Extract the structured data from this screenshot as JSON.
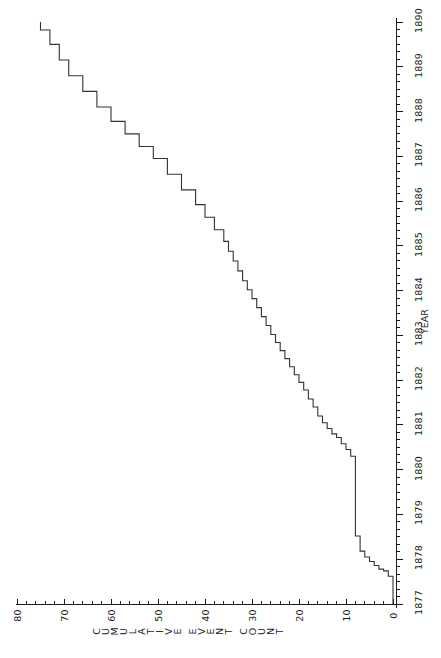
{
  "chart_data": {
    "type": "line",
    "subtype": "step-function (cumulative)",
    "orientation": "rotated-90-counterclockwise",
    "title": "",
    "xlabel": "YEAR",
    "ylabel": "CUMULATIVE EVENT COUNT",
    "xlim": [
      1877,
      1890
    ],
    "ylim": [
      0,
      80
    ],
    "x_ticks": [
      1877,
      1878,
      1879,
      1880,
      1881,
      1882,
      1883,
      1884,
      1885,
      1886,
      1887,
      1888,
      1889,
      1890
    ],
    "x_tick_labels": [
      "1877",
      "1878",
      "1879",
      "1880",
      "1881",
      "1882",
      "1883",
      "1884",
      "1885",
      "1886",
      "1887",
      "1888",
      "1889",
      "1890"
    ],
    "y_ticks": [
      0,
      10,
      20,
      30,
      40,
      50,
      60,
      70,
      80
    ],
    "y_tick_labels": [
      "0",
      "10",
      "20",
      "30",
      "40",
      "50",
      "60",
      "70",
      "80"
    ],
    "minor_ticks_per_interval": 5,
    "grid": false,
    "legend": null,
    "line_color": "#333333",
    "line_width": 1,
    "series": [
      {
        "name": "Cumulative event count",
        "step_type": "post",
        "x": [
          1877.0,
          1877.62,
          1877.74,
          1877.78,
          1877.86,
          1877.95,
          1878.05,
          1878.18,
          1878.34,
          1878.52,
          1879.12,
          1879.22,
          1880.3,
          1880.45,
          1880.58,
          1880.72,
          1880.8,
          1880.92,
          1881.05,
          1881.2,
          1881.4,
          1881.58,
          1881.78,
          1881.95,
          1882.12,
          1882.3,
          1882.48,
          1882.66,
          1882.84,
          1883.02,
          1883.22,
          1883.42,
          1883.62,
          1883.82,
          1884.02,
          1884.22,
          1884.44,
          1884.66,
          1884.88,
          1885.1,
          1885.36,
          1885.64,
          1885.92,
          1886.25,
          1886.6,
          1886.95,
          1887.22,
          1887.5,
          1887.78,
          1888.1,
          1888.45,
          1888.8,
          1889.15,
          1889.5,
          1889.82,
          1890.0
        ],
        "y": [
          0,
          1,
          2,
          3,
          4,
          5,
          6,
          7,
          7,
          8,
          8,
          8,
          9,
          10,
          11,
          12,
          13,
          14,
          15,
          16,
          17,
          18,
          19,
          20,
          21,
          22,
          23,
          24,
          25,
          26,
          27,
          28,
          29,
          30,
          31,
          32,
          33,
          34,
          35,
          36,
          38,
          40,
          42,
          45,
          48,
          51,
          54,
          57,
          60,
          63,
          66,
          69,
          71,
          73,
          75,
          75
        ],
        "max_value": 75,
        "start_value": 0
      }
    ],
    "annotations": []
  },
  "axes": {
    "count_axis": {
      "title": "CUMULATIVE EVENT COUNT",
      "labels": [
        "80",
        "70",
        "60",
        "50",
        "40",
        "30",
        "20",
        "10",
        "0"
      ]
    },
    "year_axis": {
      "title": "YEAR",
      "labels": [
        "1877",
        "1878",
        "1879",
        "1880",
        "1881",
        "1882",
        "1883",
        "1884",
        "1885",
        "1886",
        "1887",
        "1888",
        "1889",
        "1890"
      ]
    }
  },
  "style": {
    "background": "#ffffff",
    "ink": "#1a1a1a",
    "line": "#333333"
  }
}
